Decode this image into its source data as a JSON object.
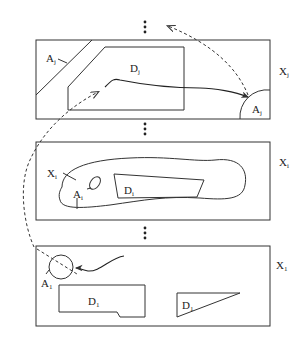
{
  "diagram": {
    "panels": [
      {
        "id": "panel-j",
        "space_label": {
          "base": "X",
          "sub": "j"
        },
        "regions": [
          {
            "name": "obstacle",
            "label": {
              "base": "A",
              "sub": "j"
            }
          },
          {
            "name": "domain",
            "label": {
              "base": "D",
              "sub": "j"
            }
          },
          {
            "name": "target",
            "label": {
              "base": "A",
              "sub": "j"
            }
          }
        ]
      },
      {
        "id": "panel-i",
        "space_label": {
          "base": "X",
          "sub": "i"
        },
        "regions": [
          {
            "name": "manifold",
            "label": {
              "base": "X",
              "sub": "i"
            }
          },
          {
            "name": "hole",
            "label": {
              "base": "A",
              "sub": "i"
            }
          },
          {
            "name": "domain",
            "label": {
              "base": "D",
              "sub": "i"
            }
          }
        ]
      },
      {
        "id": "panel-1",
        "space_label": {
          "base": "X",
          "sub": "1"
        },
        "regions": [
          {
            "name": "target",
            "label": {
              "base": "A",
              "sub": "1"
            }
          },
          {
            "name": "domain-a",
            "label": {
              "base": "D",
              "sub": "1"
            }
          },
          {
            "name": "domain-b",
            "label": {
              "base": "D",
              "sub": "1"
            }
          }
        ]
      }
    ],
    "ellipsis": [
      "⋮",
      "⋮",
      "⋮"
    ],
    "colors": {
      "stroke": "#333333",
      "background": "#ffffff"
    }
  }
}
